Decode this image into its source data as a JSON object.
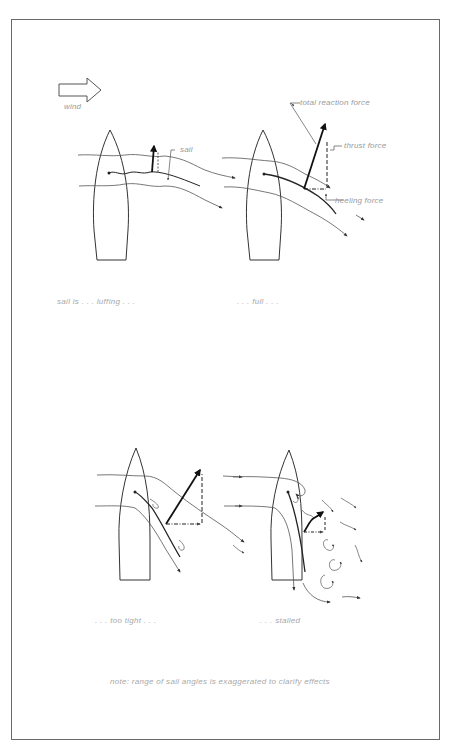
{
  "figure": {
    "legend": {
      "icon": "wind-arrow-icon",
      "label": "wind"
    },
    "panels": [
      {
        "id": "luffing",
        "caption": "sail is . . . luffing . . .",
        "labels": {
          "sail": "sail"
        }
      },
      {
        "id": "full",
        "caption": ". . . full . . .",
        "labels": {
          "total_reaction_force": "total reaction force",
          "thrust_force": "thrust force",
          "heeling_force": "heeling force"
        }
      },
      {
        "id": "too-tight",
        "caption": ". . . too tight . . ."
      },
      {
        "id": "stalled",
        "caption": ". . . stalled"
      }
    ],
    "note": "note: range of sail angles is exaggerated to clarify effects"
  },
  "colors": {
    "line": "#222222",
    "flow": "#555555",
    "text": "#9a9a9a",
    "frame": "#6a6a6a"
  }
}
